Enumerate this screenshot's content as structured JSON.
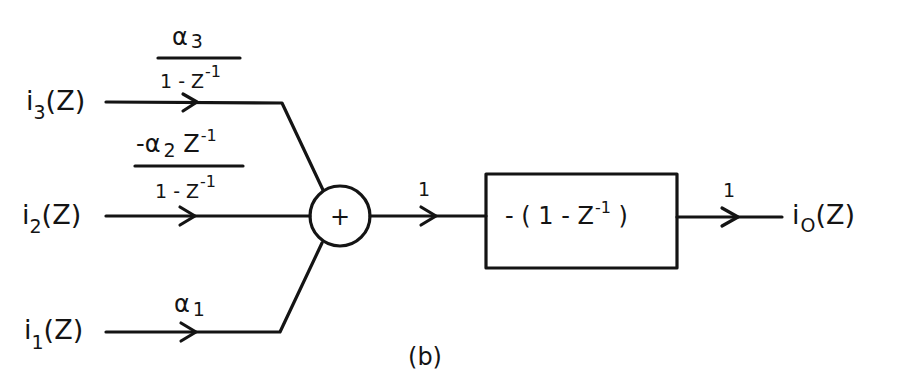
{
  "diagram": {
    "type": "block-diagram",
    "caption": "(b)",
    "colors": {
      "ink": "#141414",
      "background": "#ffffff"
    },
    "inputs": [
      {
        "id": "i3",
        "label_base": "i",
        "label_sub": "3",
        "label_arg": "(Z)",
        "gain": {
          "numerator": {
            "base": "α",
            "sub": "3"
          },
          "denominator": {
            "base": "1 - Z",
            "sup": "-1"
          }
        }
      },
      {
        "id": "i2",
        "label_base": "i",
        "label_sub": "2",
        "label_arg": "(Z)",
        "gain": {
          "numerator": {
            "prefix": "-α",
            "sub": "2",
            "mid": " Z",
            "sup": "-1"
          },
          "denominator": {
            "base": "1 - Z",
            "sup": "-1"
          }
        }
      },
      {
        "id": "i1",
        "label_base": "i",
        "label_sub": "1",
        "label_arg": "(Z)",
        "gain": {
          "base": "α",
          "sub": "1"
        }
      }
    ],
    "summer": {
      "symbol": "+"
    },
    "summer_to_block_gain": "1",
    "block": {
      "prefix": "- ( 1 - Z",
      "sup": "-1",
      "suffix": " )"
    },
    "output": {
      "gain": "1",
      "label_base": "i",
      "label_sub": "O",
      "label_arg": "(Z)"
    }
  }
}
